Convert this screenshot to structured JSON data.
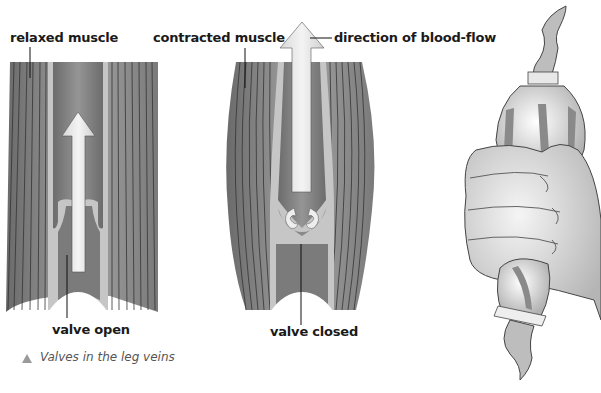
{
  "figure": {
    "labels": {
      "relaxed_muscle": "relaxed muscle",
      "contracted_muscle": "contracted muscle",
      "direction_of_blood_flow": "direction of blood-flow",
      "valve_open": "valve open",
      "valve_closed": "valve closed"
    },
    "caption": "Valves in the leg veins",
    "caption_marker": "triangle-icon",
    "panels": [
      {
        "name": "relaxed-muscle-vein",
        "state": "valve open"
      },
      {
        "name": "contracted-muscle-vein",
        "state": "valve closed"
      },
      {
        "name": "hand-squeezing-balloon",
        "state": "analogy"
      }
    ],
    "colors": {
      "muscle_dark": "#6e6e6e",
      "muscle_light": "#9c9c9c",
      "vein_wall": "#c9c9c9",
      "vein_lumen": "#7d7d7d",
      "arrow": "#e6e6e6",
      "text": "#1a1a1a",
      "caption": "#555555"
    }
  }
}
